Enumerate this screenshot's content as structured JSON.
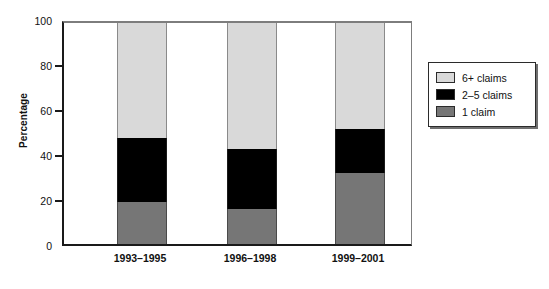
{
  "chart_data": {
    "type": "bar",
    "subtype": "stacked-bar-100",
    "title": "",
    "xlabel": "",
    "ylabel": "Percentage",
    "ylim": [
      0,
      100
    ],
    "yticks": [
      0,
      20,
      40,
      60,
      80,
      100
    ],
    "grid": false,
    "legend_position": "right",
    "categories": [
      "1993–1995",
      "1996–1998",
      "1999–2001"
    ],
    "series": [
      {
        "name": "6+ claims",
        "color": "#d9d9d9",
        "values": [
          52,
          57,
          48
        ]
      },
      {
        "name": "2–5 claims",
        "color": "#000000",
        "values": [
          29,
          27,
          20
        ]
      },
      {
        "name": "1 claim",
        "color": "#767676",
        "values": [
          19,
          16,
          32
        ]
      }
    ],
    "cumulative_tops": {
      "1 claim": [
        19,
        16,
        32
      ],
      "2-5 claims": [
        48,
        43,
        52
      ],
      "6+ claims": [
        100,
        100,
        100
      ]
    }
  },
  "axes": {
    "y_title": "Percentage",
    "y_tick_labels": [
      "100",
      "80",
      "60",
      "40",
      "20",
      "0"
    ],
    "x_tick_labels": [
      "1993–1995",
      "1996–1998",
      "1999–2001"
    ]
  },
  "legend": {
    "items": [
      {
        "label": "6+ claims",
        "color": "#d9d9d9"
      },
      {
        "label": "2–5 claims",
        "color": "#000000"
      },
      {
        "label": "1 claim",
        "color": "#767676"
      }
    ]
  },
  "colors": {
    "light_gray": "#d9d9d9",
    "black": "#000000",
    "mid_gray": "#767676",
    "axis": "#1a1a1a",
    "frame_light": "#7d7d7d",
    "background": "#ffffff"
  }
}
